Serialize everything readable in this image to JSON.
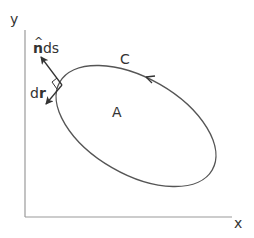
{
  "diagram": {
    "axes": {
      "x_label": "x",
      "y_label": "y"
    },
    "region_label": "A",
    "curve_label": "C",
    "normal_label": {
      "hat": "^",
      "bold": "n",
      "rest": "ds"
    },
    "tangent_label": {
      "plain": "d",
      "bold": "r"
    },
    "orientation": "counterclockwise",
    "colors": {
      "axis": "#999999",
      "curve": "#555555",
      "text": "#333333"
    }
  }
}
